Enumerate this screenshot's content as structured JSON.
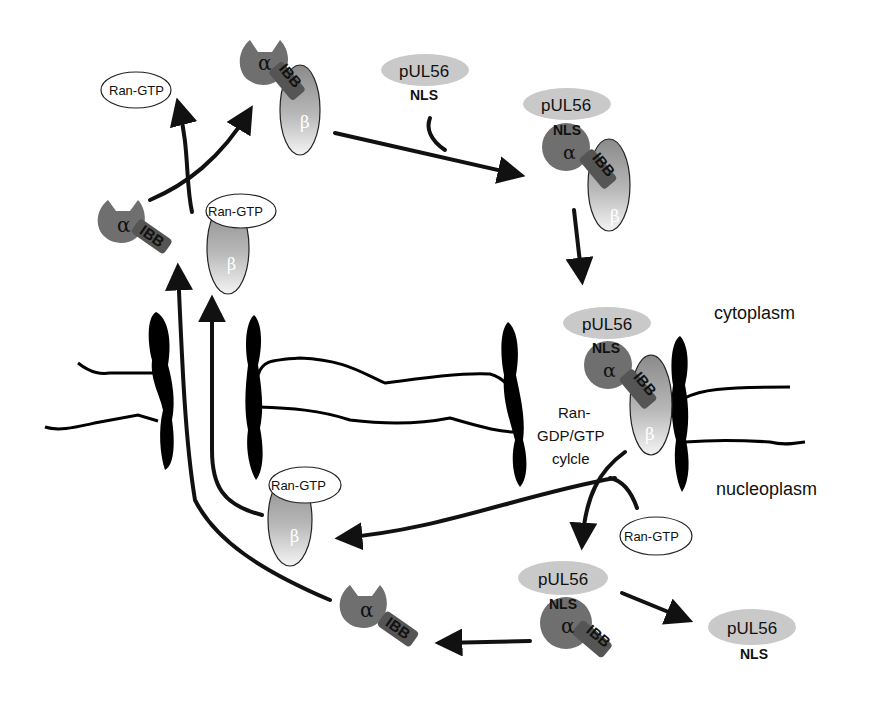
{
  "labels": {
    "pul56": "pUL56",
    "nls": "NLS",
    "alpha": "α",
    "beta": "β",
    "ibb": "IBB",
    "ran_gtp": "Ran-GTP",
    "cytoplasm": "cytoplasm",
    "nucleoplasm": "nucleoplasm",
    "ran_cycle_line1": "Ran-",
    "ran_cycle_line2": "GDP/GTP",
    "ran_cycle_line3": "cylcle"
  },
  "colors": {
    "alpha_fill": "#6f6f6f",
    "pul56_fill": "#c9c9c9",
    "beta_top": "#8c8c8c",
    "beta_bottom": "#f2f2f2",
    "membrane": "#000000",
    "arrow": "#111111"
  },
  "complexes": [
    {
      "id": "importin-alpha-beta-top",
      "members": [
        "α",
        "IBB",
        "β"
      ]
    },
    {
      "id": "pul56-free-top",
      "members": [
        "pUL56",
        "NLS"
      ]
    },
    {
      "id": "pul56-alpha-beta-cyto",
      "members": [
        "pUL56",
        "NLS",
        "α",
        "IBB",
        "β"
      ]
    },
    {
      "id": "pul56-alpha-beta-pore",
      "members": [
        "pUL56",
        "NLS",
        "α",
        "IBB",
        "β"
      ]
    },
    {
      "id": "alpha-ibb-left",
      "members": [
        "α",
        "IBB"
      ]
    },
    {
      "id": "beta-ran-gtp-left",
      "members": [
        "Ran-GTP",
        "β"
      ]
    },
    {
      "id": "ran-gtp-free-top",
      "members": [
        "Ran-GTP"
      ]
    },
    {
      "id": "beta-ran-gtp-nucleus",
      "members": [
        "Ran-GTP",
        "β"
      ]
    },
    {
      "id": "ran-gtp-free-nucleus",
      "members": [
        "Ran-GTP"
      ]
    },
    {
      "id": "pul56-alpha-nucleus",
      "members": [
        "pUL56",
        "NLS",
        "α",
        "IBB"
      ]
    },
    {
      "id": "alpha-ibb-nucleus",
      "members": [
        "α",
        "IBB"
      ]
    },
    {
      "id": "pul56-free-nucleus",
      "members": [
        "pUL56",
        "NLS"
      ]
    }
  ]
}
